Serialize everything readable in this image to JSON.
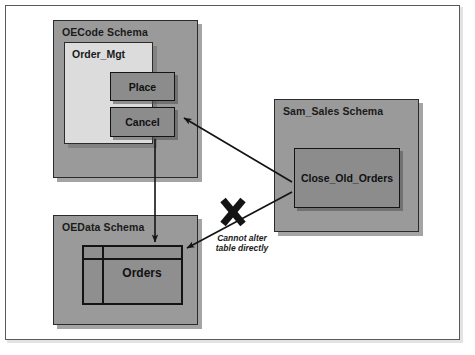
{
  "diagram": {
    "type": "schema-privileges-diagram",
    "schemas": [
      {
        "id": "oecode",
        "title": "OECode Schema",
        "package": {
          "title": "Order_Mgt",
          "procedures": [
            {
              "label": "Place"
            },
            {
              "label": "Cancel"
            }
          ]
        }
      },
      {
        "id": "samsales",
        "title": "Sam_Sales Schema",
        "procedures": [
          {
            "label": "Close_Old_Orders"
          }
        ]
      },
      {
        "id": "oedata",
        "title": "OEData Schema",
        "tables": [
          {
            "label": "Orders"
          }
        ]
      }
    ],
    "annotations": {
      "blocked_caption_line1": "Cannot alter",
      "blocked_caption_line2": "table directly",
      "blocked_marker": "x-cross-mark"
    },
    "arrows": [
      {
        "name": "close-old-orders-to-cancel",
        "from": "Close_Old_Orders",
        "to": "Cancel",
        "allowed": true
      },
      {
        "name": "cancel-to-orders-table",
        "from": "Cancel",
        "to": "Orders",
        "allowed": true
      },
      {
        "name": "close-old-orders-to-orders-table",
        "from": "Close_Old_Orders",
        "to": "Orders",
        "allowed": false
      }
    ],
    "colors": {
      "schema_fill": "#9a9a9a",
      "package_fill": "#dcdcdc",
      "procedure_fill": "#8c8c8c",
      "table_fill": "#8f8f8f",
      "outline": "#141414",
      "page_background": "#ffffff"
    }
  }
}
